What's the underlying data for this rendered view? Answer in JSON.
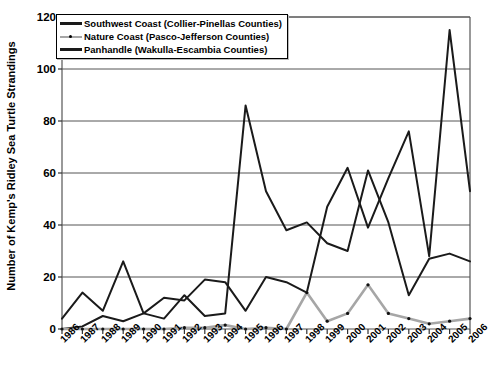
{
  "chart_data": {
    "type": "line",
    "title": "",
    "xlabel": "",
    "ylabel": "Number of Kemp's Ridley Sea Turtle Strandings",
    "xlim": [
      1986,
      2006
    ],
    "ylim": [
      0,
      120
    ],
    "ytick_step": 20,
    "grid": "horizontal",
    "legend_position": "top-left",
    "categories": [
      "1986",
      "1987",
      "1988",
      "1989",
      "1990",
      "1991",
      "1992",
      "1993",
      "1994",
      "1995",
      "1996",
      "1997",
      "1998",
      "1999",
      "2000",
      "2001",
      "2002",
      "2003",
      "2004",
      "2005",
      "2006"
    ],
    "yticks": [
      "0",
      "20",
      "40",
      "60",
      "80",
      "100",
      "120"
    ],
    "series": [
      {
        "name": "Southwest Coast (Collier-Pinellas Counties)",
        "color": "#1a1a1a",
        "style": "solid",
        "values": [
          0,
          1,
          5,
          3,
          6,
          12,
          11,
          19,
          18,
          7,
          20,
          18,
          14,
          47,
          62,
          39,
          58,
          76,
          28,
          115,
          53
        ]
      },
      {
        "name": "Nature Coast (Pasco-Jefferson Counties)",
        "color": "#a6a6a6",
        "style": "dotted-marker",
        "values": [
          0,
          0,
          0,
          0,
          0,
          0,
          0.5,
          0.5,
          1.5,
          0,
          0.5,
          0,
          14,
          3,
          6,
          17,
          6,
          4,
          2,
          3,
          4
        ]
      },
      {
        "name": "Panhandle (Wakulla-Escambia Counties)",
        "color": "#1a1a1a",
        "style": "solid",
        "values": [
          4,
          14,
          7,
          26,
          6,
          4,
          13,
          5,
          6,
          86,
          53,
          38,
          41,
          33,
          30,
          61,
          41,
          13,
          27,
          29,
          26
        ]
      }
    ]
  },
  "legend": {
    "items": [
      {
        "label": "Southwest Coast (Collier-Pinellas Counties)",
        "swatch": "solid-black-line"
      },
      {
        "label": "Nature Coast (Pasco-Jefferson Counties)",
        "swatch": "gray-dotted-line"
      },
      {
        "label": "Panhandle (Wakulla-Escambia Counties)",
        "swatch": "solid-black-line"
      }
    ]
  },
  "axes": {
    "y_title": "Number of Kemp's Ridley Sea Turtle Strandings"
  }
}
